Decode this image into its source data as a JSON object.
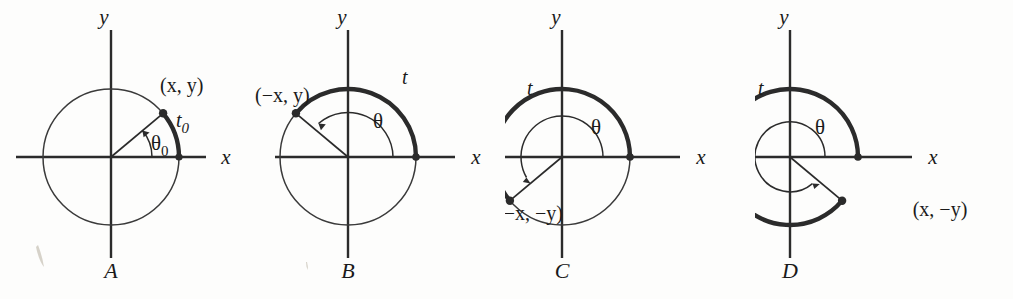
{
  "figure": {
    "background_color": "#fdfdfc",
    "line_color": "#2b2b2b"
  },
  "panels": [
    {
      "letter": "A",
      "y_axis_label": "y",
      "x_axis_label": "x",
      "angle_label": "θ₀0",
      "angle_symbol": "θ",
      "angle_subscript": "0",
      "arc_label": "t₀0",
      "arc_symbol": "t",
      "arc_subscript": "0",
      "point_label": "(x, y)",
      "terminal_angle_deg": 40,
      "arc_start_deg": 0,
      "arc_end_deg": 40,
      "arc_direction": "counterclockwise",
      "quadrant": "I"
    },
    {
      "letter": "B",
      "y_axis_label": "y",
      "x_axis_label": "x",
      "angle_label": "θ",
      "angle_symbol": "θ",
      "angle_subscript": "",
      "arc_label": "t",
      "arc_symbol": "t",
      "arc_subscript": "",
      "point_label": "(−x, y)",
      "terminal_angle_deg": 140,
      "arc_start_deg": 0,
      "arc_end_deg": 140,
      "arc_direction": "counterclockwise",
      "quadrant": "II"
    },
    {
      "letter": "C",
      "y_axis_label": "y",
      "x_axis_label": "x",
      "angle_label": "θ",
      "angle_symbol": "θ",
      "angle_subscript": "",
      "arc_label": "t",
      "arc_symbol": "t",
      "arc_subscript": "",
      "point_label": "(−x, −y)",
      "terminal_angle_deg": 220,
      "arc_start_deg": 0,
      "arc_end_deg": 220,
      "arc_direction": "counterclockwise",
      "quadrant": "III"
    },
    {
      "letter": "D",
      "y_axis_label": "y",
      "x_axis_label": "x",
      "angle_label": "θ",
      "angle_symbol": "θ",
      "angle_subscript": "",
      "arc_label": "t",
      "arc_symbol": "t",
      "arc_subscript": "",
      "point_label": "(x, −y)",
      "terminal_angle_deg": 320,
      "arc_start_deg": 0,
      "arc_end_deg": 320,
      "arc_direction": "counterclockwise",
      "quadrant": "IV"
    }
  ]
}
